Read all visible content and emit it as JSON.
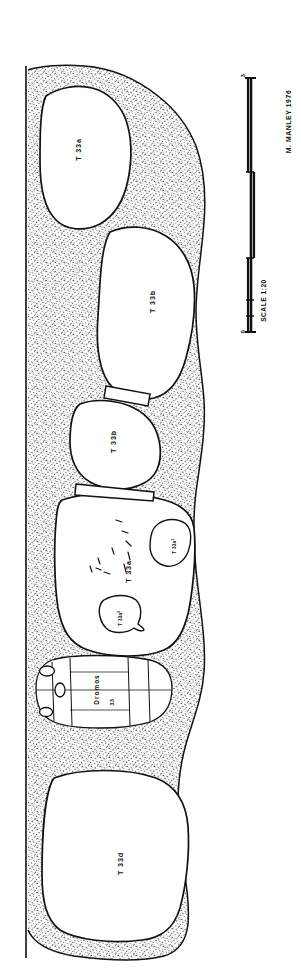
{
  "plate": {
    "title": "Tomb 33 rock-cut chamber plan",
    "ink_color": "#111111",
    "paper_color": "#ffffff",
    "stipple_color": "#1a1a1a"
  },
  "chambers": [
    {
      "id": "t33a-north",
      "label": "T 33a",
      "x": 78,
      "y": 148
    },
    {
      "id": "t33b-large",
      "label": "T 33b",
      "x": 152,
      "y": 300
    },
    {
      "id": "t33b-small",
      "label": "T 33b",
      "x": 113,
      "y": 440
    },
    {
      "id": "t33a-main",
      "label": "T 33a",
      "x": 128,
      "y": 570
    },
    {
      "id": "t33d-south",
      "label": "T 33d",
      "x": 120,
      "y": 862
    }
  ],
  "pits": [
    {
      "id": "t33a-pit-1",
      "label": "T 33a",
      "sup": "1",
      "x": 174,
      "y": 545
    },
    {
      "id": "t33a-pit-2",
      "label": "T 33a",
      "sup": "2",
      "x": 120,
      "y": 617
    }
  ],
  "dromos": {
    "label": "Dromos",
    "number": "33",
    "label_x": 96,
    "label_y": 688,
    "num_x": 112,
    "num_y": 700
  },
  "scale_bar": {
    "caption": "SCALE 1:20",
    "start_tick": "0",
    "end_tick": "3",
    "caption_x": 262,
    "caption_y": 300,
    "start_label_x": 242,
    "start_label_y": 330,
    "end_label_x": 242,
    "end_label_y": 74
  },
  "credit": {
    "text": "M. MANLEY 1976",
    "x": 285,
    "y": 120
  }
}
